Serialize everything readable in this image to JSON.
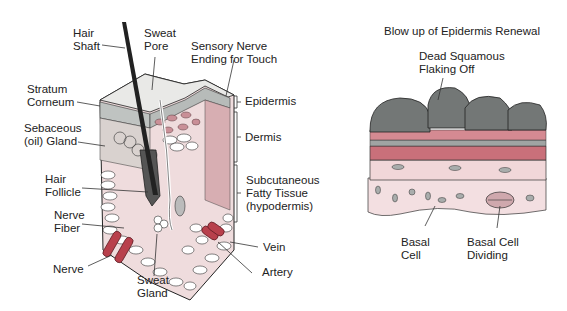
{
  "skin_diagram": {
    "labels": {
      "hair_shaft": "Hair\nShaft",
      "sweat_pore": "Sweat\nPore",
      "sensory_nerve": "Sensory Nerve\nEnding for Touch",
      "stratum_corneum": "Stratum\nCorneum",
      "sebaceous_gland": "Sebaceous\n(oil) Gland",
      "hair_follicle": "Hair\nFollicle",
      "nerve_fiber": "Nerve\nFiber",
      "nerve": "Nerve",
      "sweat_gland": "Sweat\nGland",
      "epidermis": "Epidermis",
      "dermis": "Dermis",
      "subcutaneous": "Subcutaneous\nFatty Tissue\n(hypodermis)",
      "vein": "Vein",
      "artery": "Artery"
    }
  },
  "epidermis_blowup": {
    "title": "Blow up of Epidermis Renewal",
    "labels": {
      "dead_squamous": "Dead Squamous\nFlaking Off",
      "basal_cell": "Basal\nCell",
      "basal_cell_dividing": "Basal Cell\nDividing"
    }
  },
  "colors": {
    "gray_cells": "#6f7372",
    "pink_layer": "#c9707a",
    "light_pink": "#f1d7d9",
    "dermis_pink": "#e6c3c6",
    "vessel_red": "#b8404c"
  }
}
